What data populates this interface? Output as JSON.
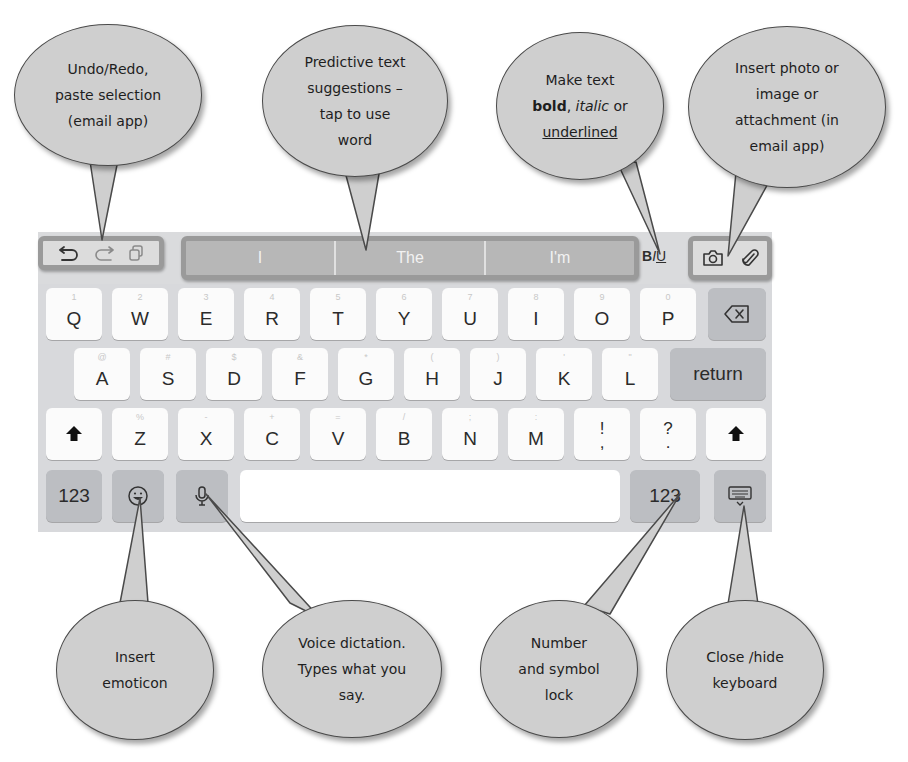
{
  "callouts": {
    "undo": {
      "lines": [
        "Undo/Redo,",
        "paste selection",
        "(email app)"
      ]
    },
    "predictive": {
      "lines": [
        "Predictive text",
        "suggestions –",
        "tap to use",
        "word"
      ]
    },
    "format": {
      "line1": "Make text",
      "bold": "bold",
      "comma": ",",
      "italic": "italic",
      "or": "or",
      "underlined": "underlined"
    },
    "attach": {
      "lines": [
        "Insert photo or",
        "image or",
        "attachment (in",
        "email app)"
      ]
    },
    "emoticon": {
      "lines": [
        "Insert",
        "emoticon"
      ]
    },
    "dictation": {
      "lines": [
        "Voice dictation.",
        "Types what you",
        "say."
      ]
    },
    "numlock": {
      "lines": [
        "Number",
        "and symbol",
        "lock"
      ]
    },
    "hide": {
      "lines": [
        "Close /hide",
        "keyboard"
      ]
    }
  },
  "toolbar": {
    "undo_icon": "undo-icon",
    "redo_icon": "redo-icon",
    "paste_icon": "paste-icon",
    "suggestions": [
      "I",
      "The",
      "I'm"
    ],
    "format": {
      "bold": "B",
      "italic": "I",
      "underline": "U"
    },
    "camera_icon": "camera-icon",
    "attach_icon": "paperclip-icon"
  },
  "keyboard": {
    "row1": [
      {
        "key": "Q",
        "sub": "1"
      },
      {
        "key": "W",
        "sub": "2"
      },
      {
        "key": "E",
        "sub": "3"
      },
      {
        "key": "R",
        "sub": "4"
      },
      {
        "key": "T",
        "sub": "5"
      },
      {
        "key": "Y",
        "sub": "6"
      },
      {
        "key": "U",
        "sub": "7"
      },
      {
        "key": "I",
        "sub": "8"
      },
      {
        "key": "O",
        "sub": "9"
      },
      {
        "key": "P",
        "sub": "0"
      }
    ],
    "row2": [
      {
        "key": "A",
        "sub": "@"
      },
      {
        "key": "S",
        "sub": "#"
      },
      {
        "key": "D",
        "sub": "$"
      },
      {
        "key": "F",
        "sub": "&"
      },
      {
        "key": "G",
        "sub": "*"
      },
      {
        "key": "H",
        "sub": "("
      },
      {
        "key": "J",
        "sub": ")"
      },
      {
        "key": "K",
        "sub": "'"
      },
      {
        "key": "L",
        "sub": "\""
      }
    ],
    "row3": [
      {
        "key": "Z",
        "sub": "%"
      },
      {
        "key": "X",
        "sub": "-"
      },
      {
        "key": "C",
        "sub": "+"
      },
      {
        "key": "V",
        "sub": "="
      },
      {
        "key": "B",
        "sub": "/"
      },
      {
        "key": "N",
        "sub": ";"
      },
      {
        "key": "M",
        "sub": ":"
      }
    ],
    "punct1": {
      "top": "!",
      "bottom": ","
    },
    "punct2": {
      "top": "?",
      "bottom": "."
    },
    "return_label": "return",
    "numbers_label": "123",
    "numbers_label_right": "123",
    "space_label": ""
  }
}
